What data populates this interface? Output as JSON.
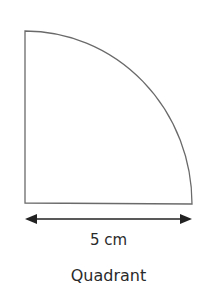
{
  "diagram": {
    "shape": "quadrant",
    "radius_label": "5 cm",
    "caption": "Quadrant",
    "stroke_color": "#555555",
    "arrow_color": "#222222"
  }
}
